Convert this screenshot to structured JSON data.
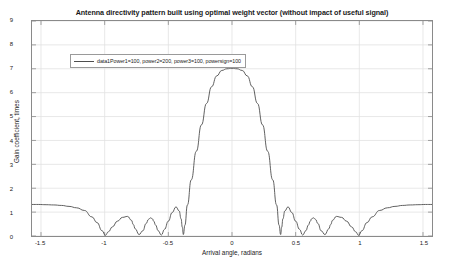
{
  "chart_data": {
    "type": "line",
    "title": "Antenna directivity pattern built using optimal weight vector (without impact of useful signal)",
    "xlabel": "Arrival angle, radians",
    "ylabel": "Gain coefficient, times",
    "xlim": [
      -1.5708,
      1.5708
    ],
    "ylim": [
      0,
      9
    ],
    "xticks": [
      -1.5,
      -1,
      -0.5,
      0,
      0.5,
      1,
      1.5
    ],
    "xtick_labels": [
      "-1.5",
      "-1",
      "-0.5",
      "0",
      "0.5",
      "1",
      "1.5"
    ],
    "yticks": [
      0,
      1,
      2,
      3,
      4,
      5,
      6,
      7,
      8,
      9
    ],
    "ytick_labels": [
      "0",
      "1",
      "2",
      "3",
      "4",
      "5",
      "6",
      "7",
      "8",
      "9"
    ],
    "grid": true,
    "legend_position": "top-left",
    "line_color": "#4d4d4d",
    "grid_color": "#e2e2e2",
    "axes_color": "#8a8a8a",
    "background_color": "#ffffff",
    "series": [
      {
        "name": "data1Power1=100, power2=200, power3=100, powersign=100",
        "x": [
          -1.5708,
          -1.52,
          -1.46,
          -1.4,
          -1.34,
          -1.28,
          -1.22,
          -1.16,
          -1.1,
          -1.06,
          -1.02,
          -0.995,
          -0.97,
          -0.94,
          -0.9,
          -0.86,
          -0.82,
          -0.79,
          -0.775,
          -0.76,
          -0.73,
          -0.7,
          -0.675,
          -0.655,
          -0.64,
          -0.625,
          -0.615,
          -0.6,
          -0.58,
          -0.555,
          -0.53,
          -0.5,
          -0.47,
          -0.44,
          -0.415,
          -0.4,
          -0.39,
          -0.382,
          -0.37,
          -0.35,
          -0.32,
          -0.28,
          -0.24,
          -0.2,
          -0.16,
          -0.12,
          -0.08,
          -0.04,
          0.0,
          0.04,
          0.08,
          0.12,
          0.16,
          0.2,
          0.24,
          0.28,
          0.32,
          0.35,
          0.37,
          0.382,
          0.39,
          0.4,
          0.415,
          0.44,
          0.47,
          0.5,
          0.53,
          0.555,
          0.58,
          0.6,
          0.615,
          0.625,
          0.64,
          0.655,
          0.675,
          0.7,
          0.73,
          0.76,
          0.775,
          0.79,
          0.82,
          0.86,
          0.9,
          0.94,
          0.97,
          0.995,
          1.02,
          1.06,
          1.1,
          1.16,
          1.22,
          1.28,
          1.34,
          1.4,
          1.46,
          1.52,
          1.5708
        ],
        "y": [
          1.32,
          1.32,
          1.31,
          1.3,
          1.28,
          1.24,
          1.18,
          1.07,
          0.8,
          0.56,
          0.22,
          0.03,
          0.18,
          0.38,
          0.62,
          0.78,
          0.82,
          0.66,
          0.48,
          0.3,
          0.06,
          0.22,
          0.52,
          0.7,
          0.76,
          0.72,
          0.62,
          0.46,
          0.22,
          0.04,
          0.28,
          0.62,
          0.98,
          1.22,
          1.05,
          0.72,
          0.36,
          0.06,
          0.45,
          1.3,
          2.35,
          3.55,
          4.65,
          5.55,
          6.25,
          6.7,
          6.93,
          7.0,
          7.02,
          7.0,
          6.93,
          6.7,
          6.25,
          5.55,
          4.65,
          3.55,
          2.35,
          1.3,
          0.45,
          0.06,
          0.36,
          0.72,
          1.05,
          1.22,
          0.98,
          0.62,
          0.28,
          0.04,
          0.22,
          0.46,
          0.62,
          0.72,
          0.76,
          0.7,
          0.52,
          0.22,
          0.06,
          0.3,
          0.48,
          0.66,
          0.82,
          0.78,
          0.62,
          0.38,
          0.18,
          0.03,
          0.22,
          0.56,
          0.8,
          1.07,
          1.18,
          1.24,
          1.28,
          1.3,
          1.31,
          1.32,
          1.32
        ]
      }
    ],
    "annotations": {
      "main_lobe_peak_value": 7.0,
      "main_lobe_peak_angle": 0,
      "edge_plateau_value": 1.32,
      "null_angles": [
        -1.0,
        -0.73,
        -0.555,
        -0.382,
        0.382,
        0.555,
        0.73,
        1.0
      ]
    }
  },
  "legend": {
    "entry_label": "data1Power1=100, power2=200, power3=100, powersign=100"
  }
}
